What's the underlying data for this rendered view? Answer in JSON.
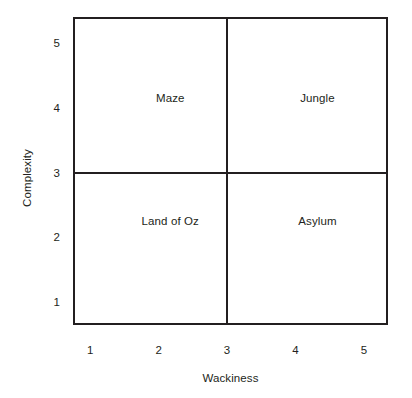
{
  "chart_data": {
    "type": "scatter",
    "title": "",
    "xlabel": "Wackiness",
    "ylabel": "Complexity",
    "xlim": [
      0.75,
      5.35
    ],
    "ylim": [
      0.65,
      5.4
    ],
    "xticks": [
      1,
      2,
      3,
      4,
      5
    ],
    "yticks": [
      1,
      2,
      3,
      4,
      5
    ],
    "xtick_labels": [
      "1",
      "2",
      "3",
      "4",
      "5"
    ],
    "ytick_labels": [
      "1",
      "2",
      "3",
      "4",
      "5"
    ],
    "grid": false,
    "legend": "none",
    "divider_x": 3,
    "divider_y": 3,
    "frame_color": "#231f20",
    "background_color": "#ffffff",
    "quadrants": [
      {
        "label": "Maze",
        "x": 2.17,
        "y": 4.15,
        "quadrant": "upper-left"
      },
      {
        "label": "Jungle",
        "x": 4.32,
        "y": 4.15,
        "quadrant": "upper-right"
      },
      {
        "label": "Land of Oz",
        "x": 2.17,
        "y": 2.25,
        "quadrant": "lower-left"
      },
      {
        "label": "Asylum",
        "x": 4.32,
        "y": 2.25,
        "quadrant": "lower-right"
      }
    ]
  },
  "figure": {
    "plot_box": {
      "left": 73,
      "top": 17,
      "width": 315,
      "height": 308
    }
  }
}
